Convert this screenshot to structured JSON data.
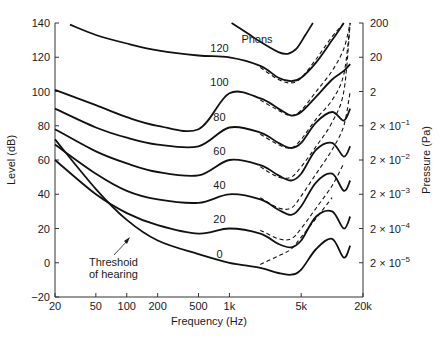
{
  "chart_data": {
    "type": "line",
    "title": "",
    "xlabel": "Frequency (Hz)",
    "ylabel": "Level (dB)",
    "y2label": "Pressure (Pa)",
    "xscale": "log",
    "xlim": [
      20,
      20000
    ],
    "ylim": [
      -20,
      140
    ],
    "grid": false,
    "x_ticks": [
      {
        "value": 20,
        "label": "20"
      },
      {
        "value": 50,
        "label": "50"
      },
      {
        "value": 100,
        "label": "100"
      },
      {
        "value": 200,
        "label": "200"
      },
      {
        "value": 500,
        "label": "500"
      },
      {
        "value": 1000,
        "label": "1k"
      },
      {
        "value": 5000,
        "label": "5k"
      },
      {
        "value": 20000,
        "label": "20k"
      }
    ],
    "y_ticks": [
      {
        "value": 140,
        "label": "140"
      },
      {
        "value": 120,
        "label": "120"
      },
      {
        "value": 100,
        "label": "100"
      },
      {
        "value": 80,
        "label": "80"
      },
      {
        "value": 60,
        "label": "60"
      },
      {
        "value": 40,
        "label": "40"
      },
      {
        "value": 20,
        "label": "20"
      },
      {
        "value": 0,
        "label": "0"
      },
      {
        "value": -20,
        "label": "−20"
      }
    ],
    "y2_ticks": [
      {
        "value": 140,
        "base": "200",
        "exp": ""
      },
      {
        "value": 120,
        "base": "20",
        "exp": ""
      },
      {
        "value": 100,
        "base": "2",
        "exp": ""
      },
      {
        "value": 80,
        "base": "2 × 10",
        "exp": "−1"
      },
      {
        "value": 60,
        "base": "2 × 10",
        "exp": "−2"
      },
      {
        "value": 40,
        "base": "2 × 10",
        "exp": "−3"
      },
      {
        "value": 20,
        "base": "2 × 10",
        "exp": "−4"
      },
      {
        "value": 0,
        "base": "2 × 10",
        "exp": "−5"
      }
    ],
    "legend_title": "Phons",
    "series": [
      {
        "name": "120 phons",
        "label": "120",
        "label_at": [
          800,
          123
        ],
        "x": [
          28,
          50,
          100,
          200,
          500,
          1000,
          2000,
          3000,
          4000,
          5000,
          7000,
          10000,
          13000
        ],
        "y": [
          139,
          133,
          128,
          124,
          121,
          120,
          115,
          108,
          106,
          108,
          117,
          130,
          140
        ],
        "dashed": {
          "x": [
            2000,
            3000,
            4000,
            5000,
            7000,
            10000,
            13000
          ],
          "y": [
            114,
            107,
            105,
            108,
            119,
            132,
            140
          ]
        }
      },
      {
        "name": "100 phons",
        "label": "100",
        "label_at": [
          800,
          103
        ],
        "x": [
          20,
          50,
          100,
          200,
          500,
          1000,
          2000,
          3000,
          4000,
          5000,
          7000,
          10000,
          13000,
          15000
        ],
        "y": [
          101,
          92,
          85,
          80,
          78,
          99,
          96,
          90,
          86,
          88,
          97,
          107,
          112,
          116
        ],
        "dashed": {
          "x": [
            2000,
            3000,
            4000,
            5000,
            7000,
            10000,
            13000,
            15000
          ],
          "y": [
            95,
            89,
            86,
            89,
            100,
            112,
            125,
            140
          ]
        }
      },
      {
        "name": "80 phons",
        "label": "80",
        "label_at": [
          800,
          83
        ],
        "x": [
          20,
          50,
          100,
          200,
          500,
          1000,
          2000,
          3000,
          4000,
          5000,
          7000,
          10000,
          13000,
          15000
        ],
        "y": [
          90,
          79,
          73,
          69,
          68,
          79,
          76,
          70,
          67,
          70,
          82,
          88,
          83,
          90
        ],
        "dashed": {
          "x": [
            2000,
            3000,
            4000,
            5000,
            7000,
            10000,
            13000,
            15000
          ],
          "y": [
            75,
            69,
            67,
            72,
            84,
            95,
            110,
            140
          ]
        }
      },
      {
        "name": "60 phons",
        "label": "60",
        "label_at": [
          800,
          63
        ],
        "x": [
          20,
          50,
          100,
          200,
          500,
          1000,
          2000,
          3000,
          4000,
          5000,
          7000,
          10000,
          13000,
          15000
        ],
        "y": [
          78,
          65,
          58,
          53,
          51,
          60,
          57,
          51,
          48,
          52,
          66,
          70,
          62,
          68
        ],
        "dashed": {
          "x": [
            2000,
            3000,
            4000,
            5000,
            7000,
            10000,
            13000,
            15000
          ],
          "y": [
            56,
            50,
            50,
            56,
            68,
            82,
            100,
            140
          ]
        }
      },
      {
        "name": "40 phons",
        "label": "40",
        "label_at": [
          800,
          43
        ],
        "x": [
          20,
          50,
          100,
          200,
          500,
          1000,
          2000,
          3000,
          4000,
          5000,
          7000,
          10000,
          13000,
          15000
        ],
        "y": [
          69,
          52,
          42,
          37,
          35,
          40,
          37,
          31,
          28,
          33,
          47,
          52,
          42,
          48
        ],
        "dashed": {
          "x": [
            2000,
            3000,
            4000,
            5000,
            7000,
            10000,
            13000,
            15000
          ],
          "y": [
            38,
            32,
            32,
            39,
            52,
            66,
            80,
            100
          ]
        }
      },
      {
        "name": "20 phons",
        "label": "20",
        "label_at": [
          800,
          23
        ],
        "x": [
          20,
          50,
          100,
          200,
          500,
          1000,
          2000,
          3000,
          4000,
          5000,
          7000,
          10000,
          13000,
          15000
        ],
        "y": [
          60,
          40,
          29,
          22,
          17,
          20,
          17,
          11,
          9,
          13,
          27,
          30,
          20,
          27
        ],
        "dashed": {
          "x": [
            2000,
            3000,
            4000,
            5000,
            7000,
            10000,
            13000
          ],
          "y": [
            19,
            14,
            14,
            20,
            32,
            45,
            58
          ]
        }
      },
      {
        "name": "Threshold of hearing (0 phons)",
        "label": "0",
        "label_at": [
          800,
          3
        ],
        "x": [
          20,
          50,
          100,
          200,
          500,
          1000,
          2000,
          3000,
          4000,
          5000,
          7000,
          10000,
          13000,
          15000
        ],
        "y": [
          72,
          43,
          25,
          13,
          5,
          0,
          -3,
          -6,
          -7,
          -4,
          8,
          14,
          3,
          10
        ],
        "dashed": {
          "x": [
            2000,
            3000,
            4000,
            5000,
            7000,
            10000
          ],
          "y": [
            -1,
            4,
            8,
            15,
            26,
            38
          ]
        }
      },
      {
        "name": "partial upper curve",
        "label": "",
        "x": [
          1050,
          1500,
          2000,
          3000,
          3700,
          4500,
          5500,
          6500
        ],
        "y": [
          140,
          134,
          129,
          123,
          122,
          125,
          133,
          140
        ]
      }
    ],
    "annotations": [
      {
        "text": "Threshoid\nof hearing",
        "arrow_to": [
          110,
          16
        ]
      }
    ]
  },
  "labels": {
    "legend_title": "Phons",
    "annotation_line1": "Threshoid",
    "annotation_line2": "of hearing",
    "xlabel": "Frequency (Hz)",
    "ylabel": "Level (dB)",
    "y2label": "Pressure (Pa)"
  }
}
